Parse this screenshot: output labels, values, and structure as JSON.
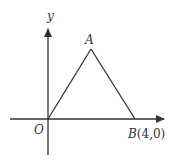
{
  "diagram": {
    "type": "coordinate-geometry",
    "axes": {
      "x_label": "",
      "y_label": "y",
      "origin_label": "O"
    },
    "points": {
      "O": {
        "label": "O",
        "coords": [
          0,
          0
        ]
      },
      "A": {
        "label": "A"
      },
      "B": {
        "label": "B",
        "coords_text": "(4,0)",
        "coords": [
          4,
          0
        ]
      }
    },
    "shape": "triangle OAB",
    "colors": {
      "ink": "#333333",
      "background": "#ffffff"
    }
  }
}
